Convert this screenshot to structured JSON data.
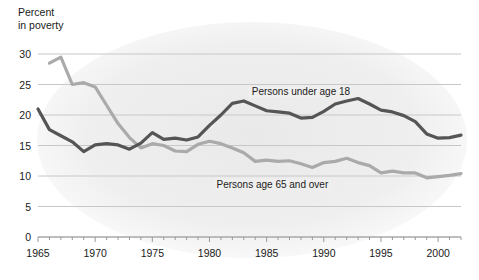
{
  "chart_data": {
    "type": "line",
    "title": "",
    "ylabel": "Percent\nin poverty",
    "xlabel": "",
    "ylim": [
      0,
      30
    ],
    "yticks": [
      0,
      5,
      10,
      15,
      20,
      25,
      30
    ],
    "xlim": [
      1965,
      2002
    ],
    "xticks_labeled": [
      1965,
      1970,
      1975,
      1980,
      1985,
      1990,
      1995,
      2000
    ],
    "xticks_minor_step": 1,
    "grid": "horizontal",
    "legend": "inline-annotations",
    "annotations": [
      {
        "text": "Persons under age 18",
        "x": 1988,
        "y": 23.2,
        "series": "under18"
      },
      {
        "text": "Persons age 65 and over",
        "x": 1985.5,
        "y": 8.0,
        "series": "over65"
      }
    ],
    "colors": {
      "under18": "#555555",
      "over65": "#aaaaaa",
      "grid": "#c8c8c8",
      "axis": "#999999",
      "text": "#1a1a1a"
    },
    "x": [
      1965,
      1966,
      1967,
      1968,
      1969,
      1970,
      1971,
      1972,
      1973,
      1974,
      1975,
      1976,
      1977,
      1978,
      1979,
      1980,
      1981,
      1982,
      1983,
      1984,
      1985,
      1986,
      1987,
      1988,
      1989,
      1990,
      1991,
      1992,
      1993,
      1994,
      1995,
      1996,
      1997,
      1998,
      1999,
      2000,
      2001,
      2002
    ],
    "series": [
      {
        "name": "Persons under age 18",
        "key": "under18",
        "color": "#555555",
        "values": [
          21.0,
          17.6,
          16.6,
          15.6,
          14.0,
          15.1,
          15.3,
          15.1,
          14.4,
          15.4,
          17.1,
          16.0,
          16.2,
          15.9,
          16.4,
          18.3,
          20.0,
          21.9,
          22.3,
          21.5,
          20.7,
          20.5,
          20.3,
          19.5,
          19.6,
          20.6,
          21.8,
          22.3,
          22.7,
          21.8,
          20.8,
          20.5,
          19.9,
          18.9,
          16.9,
          16.2,
          16.3,
          16.7
        ]
      },
      {
        "name": "Persons age 65 and over",
        "key": "over65",
        "color": "#aaaaaa",
        "values": [
          null,
          28.5,
          29.5,
          25.0,
          25.3,
          24.6,
          21.6,
          18.6,
          16.3,
          14.6,
          15.3,
          15.0,
          14.1,
          14.0,
          15.2,
          15.7,
          15.3,
          14.6,
          13.8,
          12.4,
          12.6,
          12.4,
          12.5,
          12.0,
          11.4,
          12.2,
          12.4,
          12.9,
          12.2,
          11.7,
          10.5,
          10.8,
          10.5,
          10.5,
          9.7,
          9.9,
          10.1,
          10.4
        ]
      }
    ]
  },
  "axis_label_text": "Percent\nin poverty"
}
